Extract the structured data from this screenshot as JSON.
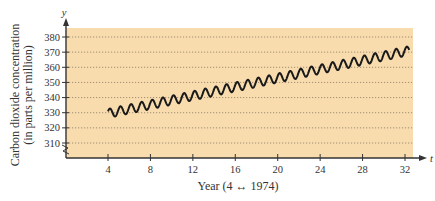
{
  "chart_data": {
    "type": "line",
    "title": "",
    "xlabel": "Year (4 ↔ 1974)",
    "ylabel_line1": "Carbon dioxide concentration",
    "ylabel_line2": "(in parts per million)",
    "x_axis_var": "t",
    "y_axis_var": "y",
    "xlim": [
      0,
      33
    ],
    "ylim": [
      302,
      384
    ],
    "x_ticks": [
      4,
      8,
      12,
      16,
      20,
      24,
      28,
      32
    ],
    "x_tick_labels": [
      "4",
      "8",
      "12",
      "16",
      "20",
      "24",
      "28",
      "32"
    ],
    "y_ticks": [
      310,
      320,
      330,
      340,
      350,
      360,
      370,
      380
    ],
    "y_tick_labels": [
      "310",
      "320",
      "330",
      "340",
      "350",
      "360",
      "370",
      "380"
    ],
    "y_axis_break": true,
    "grid": "horizontal-dotted",
    "legend": "none",
    "series": [
      {
        "name": "CO2 concentration",
        "model": "trend + seasonal oscillation",
        "t_start": 4,
        "t_end": 32.4,
        "start_value": 329.5,
        "end_value": 371,
        "trend_ppm_per_year": 1.46,
        "seasonal_amplitude_ppm": 3,
        "cycles_per_year": 1,
        "sample_points": [
          {
            "t": 4,
            "y": 329.5
          },
          {
            "t": 8,
            "y": 335
          },
          {
            "t": 12,
            "y": 341
          },
          {
            "t": 16,
            "y": 347
          },
          {
            "t": 20,
            "y": 353
          },
          {
            "t": 24,
            "y": 359
          },
          {
            "t": 28,
            "y": 365
          },
          {
            "t": 32,
            "y": 371
          }
        ]
      }
    ],
    "colors": {
      "plot_background": "#f8dcae",
      "curve": "#1a1a1a",
      "axis": "#333333",
      "grid": "#8a7a66"
    }
  }
}
